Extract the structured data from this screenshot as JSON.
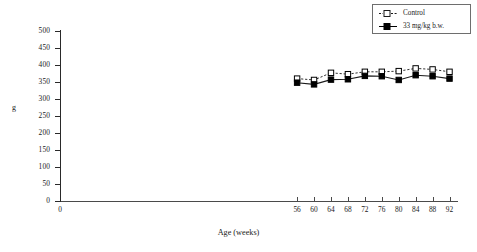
{
  "chart_data": {
    "type": "line",
    "title": "",
    "xlabel": "Age (weeks)",
    "ylabel": "g",
    "xlim": [
      0,
      94
    ],
    "ylim": [
      0,
      500
    ],
    "grid": false,
    "legend_position": "top-right",
    "x": [
      56,
      60,
      64,
      68,
      72,
      76,
      80,
      84,
      88,
      92
    ],
    "xtick_labels": [
      "0",
      "56",
      "60",
      "64",
      "68",
      "72",
      "76",
      "80",
      "84",
      "88",
      "92"
    ],
    "xtick_values": [
      0,
      56,
      60,
      64,
      68,
      72,
      76,
      80,
      84,
      88,
      92
    ],
    "ytick_labels": [
      "0",
      "50",
      "100",
      "150",
      "200",
      "250",
      "300",
      "350",
      "400",
      "450",
      "500"
    ],
    "ytick_values": [
      0,
      50,
      100,
      150,
      200,
      250,
      300,
      350,
      400,
      450,
      500
    ],
    "series": [
      {
        "name": "Control",
        "marker": "open-square",
        "line": "dashed",
        "values": [
          360,
          356,
          377,
          373,
          380,
          380,
          382,
          390,
          387,
          380
        ]
      },
      {
        "name": "33 mg/kg b.w.",
        "marker": "filled-square",
        "line": "solid",
        "values": [
          348,
          343,
          357,
          358,
          368,
          367,
          356,
          370,
          367,
          360
        ]
      }
    ]
  },
  "legend": {
    "entries": [
      {
        "label": "Control"
      },
      {
        "label": "33 mg/kg b.w."
      }
    ]
  },
  "colors": {
    "axis": "#2a2a2a",
    "series_control": "#1a1a1a",
    "series_dose": "#000000",
    "background": "#ffffff"
  }
}
